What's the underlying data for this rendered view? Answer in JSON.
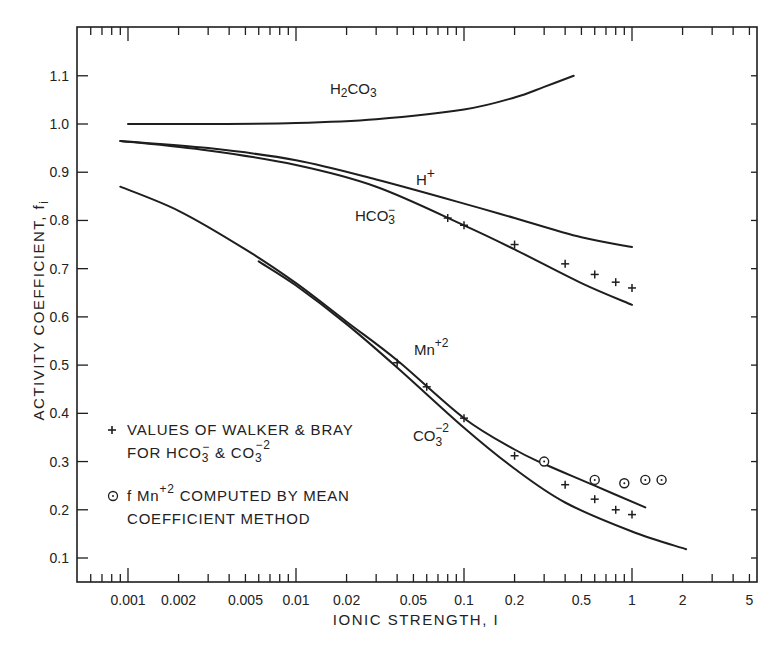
{
  "chart_data": {
    "type": "line",
    "title": "",
    "xlabel": "IONIC STRENGTH, I",
    "ylabel": "ACTIVITY COEFFICIENT, f",
    "ylabel_subscript": "i",
    "xscale": "log",
    "xlim": [
      0.0003,
      5
    ],
    "ylim": [
      0.05,
      1.2
    ],
    "grid": false,
    "x_ticks": [
      0.001,
      0.002,
      0.005,
      0.01,
      0.02,
      0.05,
      0.1,
      0.2,
      0.5,
      1,
      2,
      5
    ],
    "x_tick_labels": [
      "0.001",
      "0.002",
      "0.005",
      "0.01",
      "0.02",
      "0.05",
      "0.1",
      "0.2",
      "0.5",
      "1",
      "2",
      "5"
    ],
    "y_ticks": [
      0.1,
      0.2,
      0.3,
      0.4,
      0.5,
      0.6,
      0.7,
      0.8,
      0.9,
      1.0,
      1.1
    ],
    "y_tick_labels": [
      "0.1",
      "0.2",
      "0.3",
      "0.4",
      "0.5",
      "0.6",
      "0.7",
      "0.8",
      "0.9",
      "1.0",
      "1.1"
    ],
    "series": [
      {
        "name": "H2CO3",
        "label": "H₂CO₃",
        "kind": "curve",
        "x": [
          0.001,
          0.003,
          0.01,
          0.03,
          0.1,
          0.2,
          0.3,
          0.45
        ],
        "y": [
          1.0,
          1.0,
          1.002,
          1.01,
          1.03,
          1.055,
          1.077,
          1.1
        ]
      },
      {
        "name": "H+",
        "label": "H⁺",
        "kind": "curve",
        "x": [
          0.0009,
          0.003,
          0.01,
          0.03,
          0.1,
          0.2,
          0.5,
          1.0
        ],
        "y": [
          0.965,
          0.95,
          0.925,
          0.885,
          0.835,
          0.805,
          0.765,
          0.745
        ]
      },
      {
        "name": "HCO3-",
        "label": "HCO₃⁻",
        "kind": "curve",
        "x": [
          0.0009,
          0.003,
          0.01,
          0.03,
          0.1,
          0.2,
          0.5,
          1.0
        ],
        "y": [
          0.965,
          0.945,
          0.915,
          0.87,
          0.79,
          0.74,
          0.67,
          0.625
        ]
      },
      {
        "name": "Mn+2",
        "label": "Mn⁺²",
        "kind": "curve",
        "x": [
          0.0009,
          0.002,
          0.005,
          0.01,
          0.02,
          0.04,
          0.1,
          0.2,
          0.3,
          0.6,
          1.2
        ],
        "y": [
          0.87,
          0.82,
          0.74,
          0.67,
          0.59,
          0.51,
          0.39,
          0.325,
          0.295,
          0.25,
          0.205
        ]
      },
      {
        "name": "CO3-2",
        "label": "CO₃⁻²",
        "kind": "curve",
        "x": [
          0.006,
          0.01,
          0.02,
          0.04,
          0.1,
          0.2,
          0.4,
          1.0,
          2.1
        ],
        "y": [
          0.715,
          0.665,
          0.585,
          0.495,
          0.37,
          0.285,
          0.215,
          0.155,
          0.118
        ]
      },
      {
        "name": "Walker & Bray (HCO3-)",
        "kind": "points",
        "marker": "plus",
        "x": [
          0.08,
          0.1,
          0.2,
          0.4,
          0.6,
          0.8,
          1.0
        ],
        "y": [
          0.805,
          0.79,
          0.75,
          0.71,
          0.688,
          0.672,
          0.66
        ]
      },
      {
        "name": "Walker & Bray (CO3-2)",
        "kind": "points",
        "marker": "plus",
        "x": [
          0.04,
          0.06,
          0.1,
          0.2,
          0.4,
          0.6,
          0.8,
          1.0
        ],
        "y": [
          0.505,
          0.455,
          0.39,
          0.312,
          0.252,
          0.222,
          0.2,
          0.19
        ]
      },
      {
        "name": "fMn+2 mean coefficient",
        "kind": "points",
        "marker": "circle-dot",
        "x": [
          0.3,
          0.6,
          0.9,
          1.2,
          1.5
        ],
        "y": [
          0.3,
          0.262,
          0.255,
          0.262,
          0.262
        ]
      }
    ],
    "curve_labels": [
      {
        "text": "H2CO3",
        "base": "H",
        "sub1": "2",
        "mid": "CO",
        "sub2": "3",
        "x": 0.05,
        "y": 1.095
      },
      {
        "text": "H+",
        "x": 0.07,
        "y": 0.885
      },
      {
        "text": "HCO3-",
        "x": 0.035,
        "y": 0.815
      },
      {
        "text": "Mn+2",
        "x": 0.055,
        "y": 0.545
      },
      {
        "text": "CO3-2",
        "x": 0.055,
        "y": 0.36
      }
    ],
    "legend": {
      "position": "lower-left",
      "entries": [
        {
          "marker": "plus",
          "line1": "VALUES OF  WALKER & BRAY",
          "line2": "FOR  HCO₃⁻ & CO₃⁻²"
        },
        {
          "marker": "circle-dot",
          "line1": "f Mn⁺² COMPUTED BY MEAN",
          "line2": "COEFFICIENT  METHOD"
        }
      ]
    }
  },
  "labels": {
    "xlabel": "IONIC STRENGTH, I",
    "ylabel": "ACTIVITY COEFFICIENT, f",
    "ylabel_sub": "i",
    "curve_h2co3": "H",
    "curve_h2co3_sub": "2",
    "curve_h2co3_mid": "CO",
    "curve_h2co3_sub2": "3",
    "curve_hplus": "H",
    "curve_hplus_sup": "+",
    "curve_hco3": "HCO",
    "curve_hco3_sub": "3",
    "curve_hco3_sup": "−",
    "curve_mn": "Mn",
    "curve_mn_sup": "+2",
    "curve_co3": "CO",
    "curve_co3_sub": "3",
    "curve_co3_sup": "−2",
    "legend_1_line1": "VALUES OF  WALKER & BRAY",
    "legend_1_line2a": "FOR  HCO",
    "legend_1_line2_sub": "3",
    "legend_1_line2_sup": "−",
    "legend_1_line2b": " & CO",
    "legend_1_line2_sub2": "3",
    "legend_1_line2_sup2": "−2",
    "legend_2_pre": "f Mn",
    "legend_2_sup": "+2",
    "legend_2_line1b": " COMPUTED BY MEAN",
    "legend_2_line2": "COEFFICIENT  METHOD"
  },
  "colors": {
    "ink": "#1e1e1e",
    "background": "#ffffff"
  }
}
